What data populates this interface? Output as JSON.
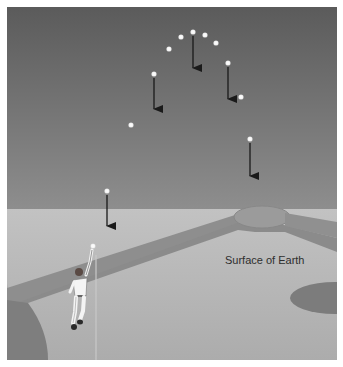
{
  "figure": {
    "label_surface": "Surface of Earth",
    "colors": {
      "sky_top": "#5a5a5a",
      "sky_bottom": "#8c8c8c",
      "ground": "#b4b4b4",
      "ground_light": "#bcbcbc",
      "grass_strip": "#8a8a8a",
      "mound": "#999999",
      "dark_patch": "#7a7a7a",
      "ball": "#ffffff",
      "arrow": "#1a1a1a"
    },
    "ball_positions": [
      {
        "x": 93,
        "y": 246
      },
      {
        "x": 107,
        "y": 191
      },
      {
        "x": 131,
        "y": 125
      },
      {
        "x": 154,
        "y": 74
      },
      {
        "x": 169,
        "y": 49
      },
      {
        "x": 181,
        "y": 37
      },
      {
        "x": 193,
        "y": 32
      },
      {
        "x": 205,
        "y": 35
      },
      {
        "x": 216,
        "y": 43
      },
      {
        "x": 228,
        "y": 63
      },
      {
        "x": 241,
        "y": 97
      },
      {
        "x": 250,
        "y": 139
      }
    ],
    "gravity_arrows": [
      {
        "x": 107,
        "y1": 195,
        "y2": 226
      },
      {
        "x": 154,
        "y1": 78,
        "y2": 109
      },
      {
        "x": 193,
        "y1": 36,
        "y2": 68
      },
      {
        "x": 228,
        "y1": 67,
        "y2": 99
      },
      {
        "x": 250,
        "y1": 143,
        "y2": 176
      }
    ]
  }
}
